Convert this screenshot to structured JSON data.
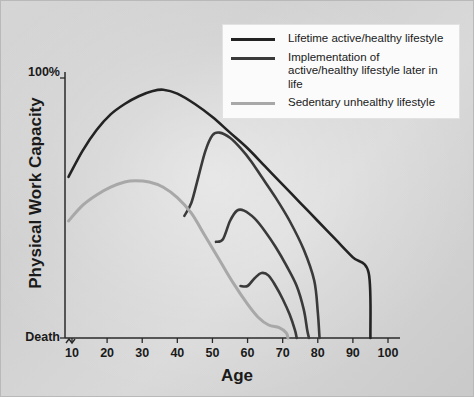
{
  "chart_data": {
    "type": "line",
    "title": "",
    "xlabel": "Age",
    "ylabel": "Physical Work Capacity",
    "xlim": [
      5,
      103
    ],
    "ylim": [
      0,
      110
    ],
    "grid": false,
    "x_ticks": [
      10,
      20,
      30,
      40,
      50,
      60,
      70,
      80,
      90,
      100
    ],
    "x_tick_labels": [
      "10",
      "20",
      "30",
      "40",
      "50",
      "60",
      "70",
      "80",
      "90",
      "100"
    ],
    "y_tick_labels": [
      "100%",
      "Death"
    ],
    "y_tick_values": [
      100,
      0
    ],
    "legend_position": "top-right",
    "axis_break_marker": true,
    "series": [
      {
        "name": "Lifetime active/healthy lifestyle",
        "color": "#232323",
        "width": 2.6,
        "points": [
          [
            9,
            62
          ],
          [
            13,
            72
          ],
          [
            17,
            80
          ],
          [
            21,
            86
          ],
          [
            25,
            90
          ],
          [
            29,
            93
          ],
          [
            33,
            95
          ],
          [
            36,
            95.5
          ],
          [
            40,
            94
          ],
          [
            45,
            90
          ],
          [
            50,
            85
          ],
          [
            55,
            79
          ],
          [
            60,
            73
          ],
          [
            65,
            66
          ],
          [
            70,
            59
          ],
          [
            75,
            52
          ],
          [
            80,
            45
          ],
          [
            85,
            38
          ],
          [
            90,
            31
          ],
          [
            94.5,
            25
          ],
          [
            95,
            0
          ]
        ]
      },
      {
        "name": "Implementation of active/healthy lifestyle later in life (from age 42)",
        "color": "#3a3a3a",
        "width": 2.6,
        "points": [
          [
            42,
            47
          ],
          [
            44,
            52
          ],
          [
            46,
            62
          ],
          [
            48,
            72
          ],
          [
            50,
            78
          ],
          [
            52,
            79
          ],
          [
            55,
            77
          ],
          [
            58,
            73
          ],
          [
            61,
            68
          ],
          [
            64,
            62
          ],
          [
            68,
            54
          ],
          [
            72,
            45
          ],
          [
            76,
            34
          ],
          [
            79,
            22
          ],
          [
            80,
            10
          ],
          [
            80.5,
            0
          ]
        ]
      },
      {
        "name": "Implementation of active/healthy lifestyle later in life (from age 51)",
        "color": "#3a3a3a",
        "width": 2.6,
        "points": [
          [
            51,
            37
          ],
          [
            53,
            38
          ],
          [
            55,
            45
          ],
          [
            57,
            49
          ],
          [
            59,
            49
          ],
          [
            62,
            46
          ],
          [
            65,
            41
          ],
          [
            68,
            35
          ],
          [
            71,
            28
          ],
          [
            74,
            20
          ],
          [
            76,
            11
          ],
          [
            77,
            3
          ],
          [
            77.5,
            0
          ]
        ]
      },
      {
        "name": "Implementation of active/healthy lifestyle later in life (from age 58)",
        "color": "#3a3a3a",
        "width": 2.6,
        "points": [
          [
            58,
            20
          ],
          [
            60,
            20
          ],
          [
            62,
            23
          ],
          [
            64,
            25
          ],
          [
            66,
            24
          ],
          [
            68,
            20
          ],
          [
            70,
            15
          ],
          [
            72,
            9
          ],
          [
            73.5,
            3
          ],
          [
            74,
            0
          ]
        ]
      },
      {
        "name": "Sedentary unhealthy lifestyle",
        "color": "#a8a8a8",
        "width": 3.0,
        "points": [
          [
            9,
            45
          ],
          [
            13,
            51
          ],
          [
            17,
            55
          ],
          [
            21,
            58
          ],
          [
            25,
            60
          ],
          [
            28,
            60.5
          ],
          [
            32,
            60
          ],
          [
            36,
            58
          ],
          [
            40,
            54
          ],
          [
            44,
            48
          ],
          [
            48,
            39
          ],
          [
            52,
            30
          ],
          [
            56,
            21
          ],
          [
            60,
            13
          ],
          [
            63,
            8
          ],
          [
            66,
            5
          ],
          [
            69,
            4
          ],
          [
            71,
            2
          ],
          [
            71.5,
            0
          ]
        ]
      }
    ]
  },
  "legend": {
    "items": [
      {
        "label": "Lifetime active/healthy lifestyle",
        "color": "#232323"
      },
      {
        "label": "Implementation of active/healthy lifestyle later in life",
        "color": "#3a3a3a"
      },
      {
        "label": "Sedentary unhealthy lifestyle",
        "color": "#a8a8a8"
      }
    ]
  }
}
